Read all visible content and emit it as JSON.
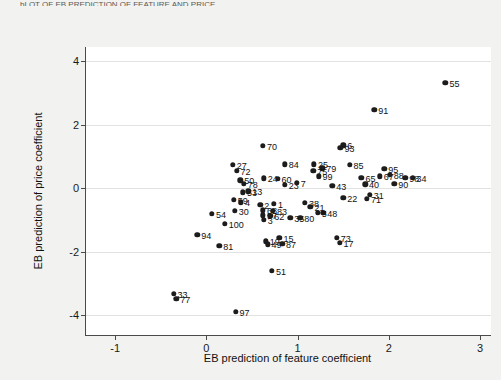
{
  "top_cut_text": "bLOT OF EB PREDICTION OF FEATURE AND PRICE",
  "chart_data": {
    "type": "scatter",
    "title": "",
    "xlabel": "EB prediction of feature coefficient",
    "ylabel": "EB prediction of price coefficient",
    "xlim": [
      -1.32,
      3.12
    ],
    "ylim": [
      -4.62,
      4.45
    ],
    "xticks": [
      -1,
      0,
      1,
      2,
      3
    ],
    "xtick_labels": [
      "-1",
      "0",
      "1",
      "2",
      "3"
    ],
    "yticks": [
      4,
      2,
      0,
      -2,
      -4
    ],
    "ytick_labels": [
      "4",
      "2",
      "0",
      "-2",
      "-4"
    ],
    "grid": "horizontal",
    "marker": "filled-circle",
    "marker_color": "#1c1c1c",
    "point_label_position": "right",
    "points": [
      {
        "label": "55",
        "x": 2.62,
        "y": 3.32
      },
      {
        "label": "91",
        "x": 1.84,
        "y": 2.47
      },
      {
        "label": "70",
        "x": 0.62,
        "y": 1.33
      },
      {
        "label": "6",
        "x": 1.5,
        "y": 1.36
      },
      {
        "label": "93",
        "x": 1.47,
        "y": 1.27
      },
      {
        "label": "27",
        "x": 0.29,
        "y": 0.74
      },
      {
        "label": "72",
        "x": 0.33,
        "y": 0.55
      },
      {
        "label": "84",
        "x": 0.86,
        "y": 0.76
      },
      {
        "label": "25",
        "x": 1.18,
        "y": 0.76
      },
      {
        "label": "79",
        "x": 1.27,
        "y": 0.63
      },
      {
        "label": "75",
        "x": 1.17,
        "y": 0.56
      },
      {
        "label": "99",
        "x": 1.23,
        "y": 0.38
      },
      {
        "label": "85",
        "x": 1.57,
        "y": 0.74
      },
      {
        "label": "95",
        "x": 1.95,
        "y": 0.62
      },
      {
        "label": "67",
        "x": 1.9,
        "y": 0.38
      },
      {
        "label": "88",
        "x": 2.01,
        "y": 0.42
      },
      {
        "label": "98",
        "x": 2.18,
        "y": 0.33
      },
      {
        "label": "34",
        "x": 2.26,
        "y": 0.33
      },
      {
        "label": "90",
        "x": 2.06,
        "y": 0.14
      },
      {
        "label": "40",
        "x": 1.74,
        "y": 0.12
      },
      {
        "label": "65",
        "x": 1.7,
        "y": 0.33
      },
      {
        "label": "31",
        "x": 1.79,
        "y": -0.2
      },
      {
        "label": "71",
        "x": 1.76,
        "y": -0.33
      },
      {
        "label": "22",
        "x": 1.5,
        "y": -0.3
      },
      {
        "label": "50",
        "x": 0.37,
        "y": 0.25
      },
      {
        "label": "24",
        "x": 0.63,
        "y": 0.31
      },
      {
        "label": "60",
        "x": 0.78,
        "y": 0.3
      },
      {
        "label": "78",
        "x": 0.41,
        "y": 0.14
      },
      {
        "label": "23",
        "x": 0.86,
        "y": 0.11
      },
      {
        "label": "7",
        "x": 0.99,
        "y": 0.17
      },
      {
        "label": "43",
        "x": 1.38,
        "y": 0.08
      },
      {
        "label": "53",
        "x": 0.4,
        "y": -0.12
      },
      {
        "label": "13",
        "x": 0.46,
        "y": -0.1
      },
      {
        "label": "59",
        "x": 0.3,
        "y": -0.36
      },
      {
        "label": "4",
        "x": 0.38,
        "y": -0.44
      },
      {
        "label": "30",
        "x": 0.31,
        "y": -0.7
      },
      {
        "label": "54",
        "x": 0.06,
        "y": -0.8
      },
      {
        "label": "100",
        "x": 0.2,
        "y": -1.12
      },
      {
        "label": "94",
        "x": -0.1,
        "y": -1.47
      },
      {
        "label": "2",
        "x": 0.59,
        "y": -0.52
      },
      {
        "label": "1",
        "x": 0.74,
        "y": -0.49
      },
      {
        "label": "68",
        "x": 0.62,
        "y": -0.69
      },
      {
        "label": "83",
        "x": 0.73,
        "y": -0.7
      },
      {
        "label": "57",
        "x": 0.62,
        "y": -0.85
      },
      {
        "label": "62",
        "x": 0.7,
        "y": -0.87
      },
      {
        "label": "3",
        "x": 0.63,
        "y": -0.99
      },
      {
        "label": "35",
        "x": 0.92,
        "y": -0.93
      },
      {
        "label": "80",
        "x": 1.03,
        "y": -0.93
      },
      {
        "label": "38",
        "x": 1.08,
        "y": -0.45
      },
      {
        "label": "21",
        "x": 1.14,
        "y": -0.58
      },
      {
        "label": "48",
        "x": 1.28,
        "y": -0.78
      },
      {
        "label": "5",
        "x": 1.22,
        "y": -0.78
      },
      {
        "label": "81",
        "x": 0.14,
        "y": -1.82
      },
      {
        "label": "19",
        "x": 0.65,
        "y": -1.67
      },
      {
        "label": "49",
        "x": 0.67,
        "y": -1.76
      },
      {
        "label": "15",
        "x": 0.8,
        "y": -1.55
      },
      {
        "label": "87",
        "x": 0.83,
        "y": -1.74
      },
      {
        "label": "73",
        "x": 1.43,
        "y": -1.55
      },
      {
        "label": "17",
        "x": 1.46,
        "y": -1.72
      },
      {
        "label": "51",
        "x": 0.72,
        "y": -2.6
      },
      {
        "label": "33",
        "x": -0.36,
        "y": -3.32
      },
      {
        "label": "77",
        "x": -0.33,
        "y": -3.48
      },
      {
        "label": "97",
        "x": 0.32,
        "y": -3.88
      }
    ]
  }
}
